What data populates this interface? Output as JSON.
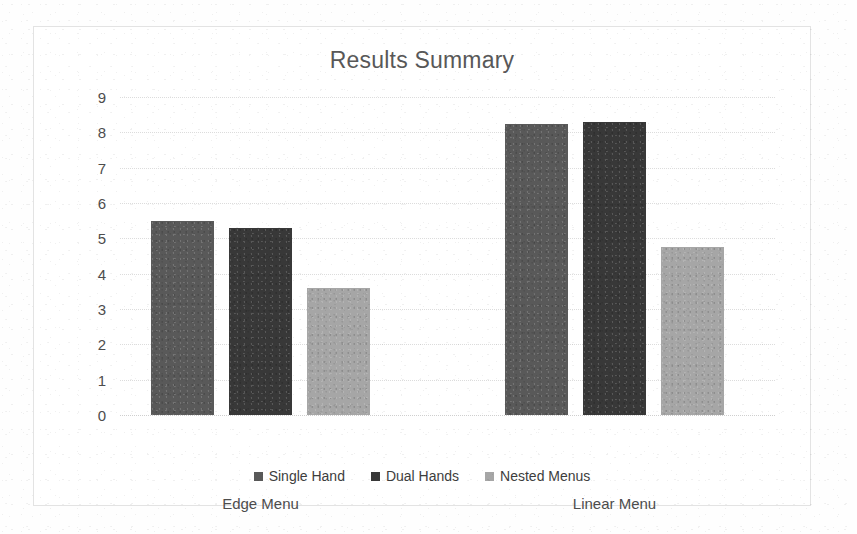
{
  "chart_data": {
    "type": "bar",
    "title": "Results Summary",
    "xlabel": "",
    "ylabel": "",
    "categories": [
      "Edge Menu",
      "Linear Menu"
    ],
    "series": [
      {
        "name": "Single Hand",
        "values": [
          5.5,
          8.25
        ],
        "color": "#595959"
      },
      {
        "name": "Dual Hands",
        "values": [
          5.3,
          8.3
        ],
        "color": "#383838"
      },
      {
        "name": "Nested Menus",
        "values": [
          3.6,
          4.75
        ],
        "color": "#a6a6a6"
      }
    ],
    "ylim": [
      0,
      9
    ],
    "ytick_labels": [
      "9",
      "8",
      "7",
      "6",
      "5",
      "4",
      "3",
      "2",
      "1",
      "0"
    ],
    "ytick_values": [
      9,
      8,
      7,
      6,
      5,
      4,
      3,
      2,
      1,
      0
    ],
    "grid": true,
    "grid_style": "dotted",
    "grid_color": "#dcdcdc",
    "legend_position": "bottom",
    "plot_background": "#ffffff",
    "frame_border_color": "#e3e3e3",
    "title_color": "#585858",
    "tick_label_color": "#4d4d4d"
  }
}
